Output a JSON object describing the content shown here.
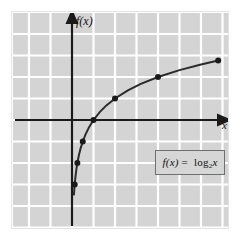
{
  "figure": {
    "background_color": "#ffffff",
    "plot_background_color": "#d4d4d4",
    "grid_color": "#ffffff",
    "axis_color": "#1a1a1a",
    "curve_color": "#2b2b2b",
    "point_color": "#1a1a1a",
    "frame_color": "#e3e3e3"
  },
  "labels": {
    "y_axis": "f(x)",
    "x_axis": "x"
  },
  "formula": {
    "fn": "f(x)",
    "equals": "=",
    "log_word": "log",
    "base": "2",
    "argument": "x",
    "full_text": "f(x) = log₂x",
    "border_color": "#6f6f6f"
  },
  "chart_data": {
    "type": "line",
    "title": "",
    "subtitle": "",
    "xlabel": "x",
    "ylabel": "f(x)",
    "function": "f(x) = log2(x)",
    "base": 2,
    "grid": true,
    "grid_spacing_units": 1,
    "legend": "none",
    "annotations": [
      {
        "text": "f(x) = log₂x",
        "type": "boxed-equation",
        "x": 5.5,
        "y": -1.5
      }
    ],
    "xlim": [
      -3.4,
      7.2
    ],
    "ylim": [
      -5.6,
      5.0
    ],
    "x_axis_position": 0,
    "y_axis_position": 0,
    "arrowheads": {
      "x_positive": true,
      "y_positive": true,
      "x_negative": false,
      "y_negative": false
    },
    "points": [
      {
        "x": 0.125,
        "y": -3
      },
      {
        "x": 0.25,
        "y": -2
      },
      {
        "x": 0.5,
        "y": -1
      },
      {
        "x": 1,
        "y": 0
      },
      {
        "x": 2,
        "y": 1
      },
      {
        "x": 4,
        "y": 2
      },
      {
        "x": 6.8,
        "y": 2.77
      }
    ],
    "series": [
      {
        "name": "log2(x)",
        "x": [
          0.09,
          0.11,
          0.125,
          0.16,
          0.2,
          0.25,
          0.32,
          0.4,
          0.5,
          0.63,
          0.8,
          1,
          1.3,
          1.6,
          2,
          2.6,
          3.2,
          4,
          5,
          6,
          6.8
        ],
        "values": [
          -3.47,
          -3.18,
          -3.0,
          -2.64,
          -2.32,
          -2.0,
          -1.64,
          -1.32,
          -1.0,
          -0.67,
          -0.32,
          0.0,
          0.38,
          0.68,
          1.0,
          1.38,
          1.68,
          2.0,
          2.32,
          2.58,
          2.77
        ]
      }
    ]
  }
}
